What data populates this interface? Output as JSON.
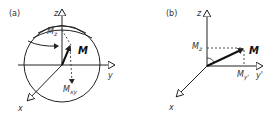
{
  "panels": [
    {
      "id": "a",
      "label": "(a)",
      "axes": {
        "x": "x",
        "y": "y",
        "z": "z"
      },
      "vector_label": "M",
      "component_z": {
        "main": "M",
        "sub": "z"
      },
      "component_xy": {
        "main": "M",
        "sub": "xy"
      }
    },
    {
      "id": "b",
      "label": "(b)",
      "axes": {
        "x": "x",
        "y": "y'",
        "z": "z"
      },
      "vector_label": "M",
      "component_z": {
        "main": "M",
        "sub": "z"
      },
      "component_y": {
        "main": "M",
        "sub": "y'"
      }
    }
  ]
}
